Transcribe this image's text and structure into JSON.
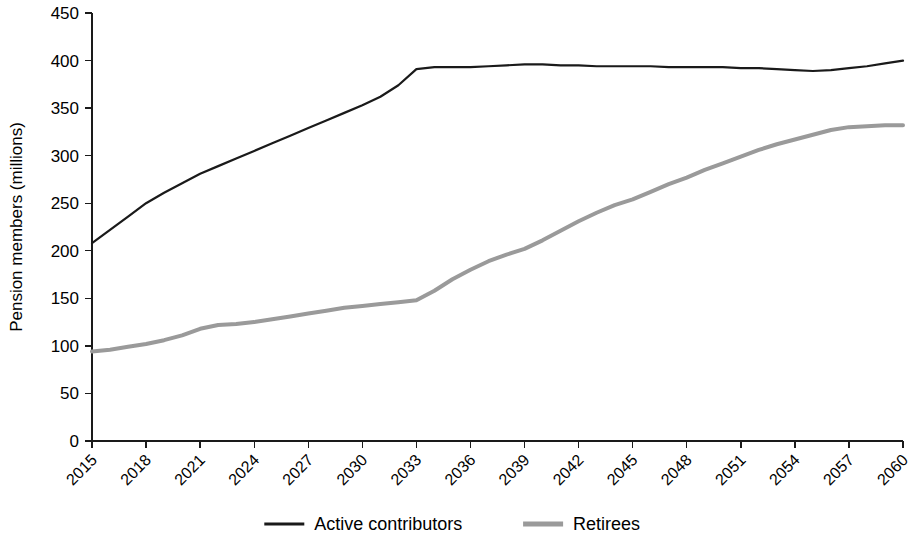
{
  "chart_data": {
    "type": "line",
    "title": "",
    "subtitle": "",
    "xlabel": "",
    "ylabel": "Pension members (millions)",
    "xlim": [
      2015,
      2060
    ],
    "ylim": [
      0,
      450
    ],
    "yticks": [
      0,
      50,
      100,
      150,
      200,
      250,
      300,
      350,
      400,
      450
    ],
    "ytick_labels": [
      "0",
      "50",
      "100",
      "150",
      "200",
      "250",
      "300",
      "350",
      "400",
      "450"
    ],
    "xticks": [
      2015,
      2018,
      2021,
      2024,
      2027,
      2030,
      2033,
      2036,
      2039,
      2042,
      2045,
      2048,
      2051,
      2054,
      2057,
      2060
    ],
    "xtick_labels": [
      "2015",
      "2018",
      "2021",
      "2024",
      "2027",
      "2030",
      "2033",
      "2036",
      "2039",
      "2042",
      "2045",
      "2048",
      "2051",
      "2054",
      "2057",
      "2060"
    ],
    "xtick_rotation": -45,
    "grid": false,
    "legend_position": "bottom",
    "x": [
      2015,
      2016,
      2017,
      2018,
      2019,
      2020,
      2021,
      2022,
      2023,
      2024,
      2025,
      2026,
      2027,
      2028,
      2029,
      2030,
      2031,
      2032,
      2033,
      2034,
      2035,
      2036,
      2037,
      2038,
      2039,
      2040,
      2041,
      2042,
      2043,
      2044,
      2045,
      2046,
      2047,
      2048,
      2049,
      2050,
      2051,
      2052,
      2053,
      2054,
      2055,
      2056,
      2057,
      2058,
      2059,
      2060
    ],
    "series": [
      {
        "name": "Active contributors",
        "color": "#1a1a1a",
        "line_width": 2.2,
        "values": [
          208,
          222,
          236,
          250,
          261,
          271,
          281,
          289,
          297,
          305,
          313,
          321,
          329,
          337,
          345,
          353,
          362,
          374,
          391,
          393,
          393,
          393,
          394,
          395,
          396,
          396,
          395,
          395,
          394,
          394,
          394,
          394,
          393,
          393,
          393,
          393,
          392,
          392,
          391,
          390,
          389,
          390,
          392,
          394,
          397,
          400
        ]
      },
      {
        "name": "Retirees",
        "color": "#9a9a9a",
        "line_width": 4.0,
        "values": [
          94,
          96,
          99,
          102,
          106,
          111,
          118,
          122,
          123,
          125,
          128,
          131,
          134,
          137,
          140,
          142,
          144,
          146,
          148,
          158,
          170,
          180,
          189,
          196,
          202,
          211,
          221,
          231,
          240,
          248,
          254,
          262,
          270,
          277,
          285,
          292,
          299,
          306,
          312,
          317,
          322,
          327,
          330,
          331,
          332,
          332
        ]
      }
    ]
  },
  "legend": {
    "items": [
      {
        "label": "Active contributors",
        "color": "#1a1a1a",
        "line_width": 3
      },
      {
        "label": "Retirees",
        "color": "#9a9a9a",
        "line_width": 5
      }
    ]
  }
}
